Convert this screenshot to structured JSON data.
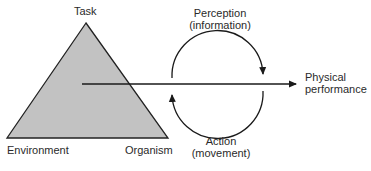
{
  "diagram": {
    "triangle": {
      "vertices": {
        "top": "Task",
        "bottom_left": "Environment",
        "bottom_right": "Organism"
      },
      "fill": "#c2c2c2",
      "stroke": "#222222"
    },
    "cycle": {
      "top_label_line1": "Perception",
      "top_label_line2": "(information)",
      "bottom_label_line1": "Action",
      "bottom_label_line2": "(movement)"
    },
    "output": {
      "label_line1": "Physical",
      "label_line2": "performance"
    }
  }
}
